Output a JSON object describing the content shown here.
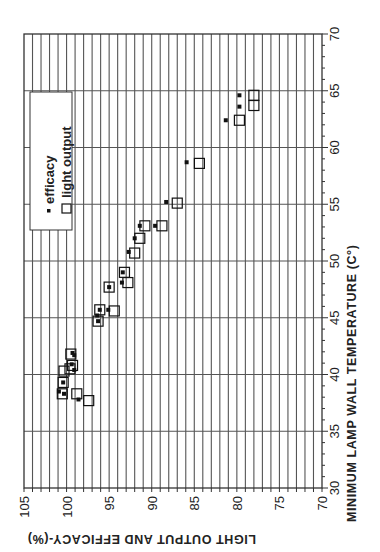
{
  "chart_data": {
    "type": "scatter",
    "orientation": "rotated-90-clockwise",
    "title": "",
    "xlabel": "MINIMUM LAMP WALL TEMPERATURE (C°)",
    "ylabel": "LIGHT OUTPUT AND EFFICACY-(%)",
    "xlim": [
      30,
      70
    ],
    "ylim": [
      70,
      105
    ],
    "x_ticks": [
      "30",
      "35",
      "40",
      "45",
      "50",
      "55",
      "60",
      "65",
      "70"
    ],
    "y_ticks": [
      "105",
      "100",
      "95",
      "90",
      "85",
      "80",
      "75",
      "70"
    ],
    "grid": true,
    "legend": {
      "position": "upper-left (rotated frame)",
      "entries": [
        "efficacy",
        "light output"
      ]
    },
    "series": [
      {
        "name": "efficacy",
        "marker": "small-filled-square",
        "points": [
          [
            64.6,
            79.7
          ],
          [
            63.6,
            79.7
          ],
          [
            62.4,
            81.3
          ],
          [
            58.7,
            85.9
          ],
          [
            55.2,
            88.3
          ],
          [
            53.1,
            89.6
          ],
          [
            53.1,
            91.4
          ],
          [
            52.0,
            92.0
          ],
          [
            50.8,
            92.7
          ],
          [
            49.0,
            93.4
          ],
          [
            48.1,
            93.5
          ],
          [
            47.7,
            95.0
          ],
          [
            45.7,
            95.1
          ],
          [
            45.7,
            96.1
          ],
          [
            45.2,
            96.4
          ],
          [
            44.7,
            96.3
          ],
          [
            41.9,
            99.3
          ],
          [
            41.7,
            99.1
          ],
          [
            40.9,
            99.4
          ],
          [
            40.4,
            99.1
          ],
          [
            39.3,
            100.4
          ],
          [
            38.5,
            100.9
          ],
          [
            38.3,
            100.3
          ],
          [
            37.8,
            98.6
          ]
        ]
      },
      {
        "name": "light output",
        "marker": "large-open-square",
        "points": [
          [
            64.6,
            78.0
          ],
          [
            63.7,
            78.0
          ],
          [
            62.4,
            79.7
          ],
          [
            58.6,
            84.4
          ],
          [
            55.1,
            87.0
          ],
          [
            53.1,
            88.8
          ],
          [
            53.1,
            90.8
          ],
          [
            52.0,
            91.4
          ],
          [
            50.7,
            92.0
          ],
          [
            49.0,
            93.2
          ],
          [
            48.1,
            92.8
          ],
          [
            47.7,
            95.0
          ],
          [
            45.6,
            94.4
          ],
          [
            45.7,
            96.1
          ],
          [
            44.7,
            96.3
          ],
          [
            41.8,
            99.5
          ],
          [
            40.8,
            99.3
          ],
          [
            40.5,
            99.6
          ],
          [
            40.3,
            100.3
          ],
          [
            39.3,
            100.4
          ],
          [
            38.3,
            100.5
          ],
          [
            38.3,
            98.8
          ],
          [
            37.7,
            97.4
          ]
        ]
      }
    ]
  },
  "labels": {
    "xlabel": "MINIMUM LAMP WALL TEMPERATURE (C°)",
    "ylabel": "LIGHT OUTPUT AND EFFICACY-(%)",
    "legend_efficacy": "efficacy",
    "legend_light": "light output"
  }
}
